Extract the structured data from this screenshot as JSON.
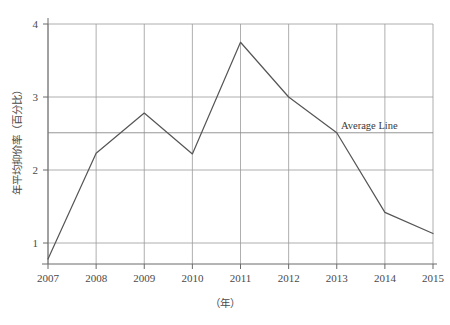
{
  "chart_data": {
    "type": "line",
    "title": "",
    "subtitle": "",
    "xlabel": "（年）",
    "ylabel": "年平均抑价率（百分比）",
    "categories": [
      "2007",
      "2008",
      "2009",
      "2010",
      "2011",
      "2012",
      "2013",
      "2014",
      "2015"
    ],
    "x": [
      2007,
      2008,
      2009,
      2010,
      2011,
      2012,
      2013,
      2014,
      2015
    ],
    "values": [
      0.78,
      2.23,
      2.78,
      2.22,
      3.75,
      3.0,
      2.51,
      1.42,
      1.13
    ],
    "series": [
      {
        "name": "年平均抑价率",
        "values": [
          0.78,
          2.23,
          2.78,
          2.22,
          3.75,
          3.0,
          2.51,
          1.42,
          1.13
        ]
      }
    ],
    "ylim": [
      0.55,
      4.15
    ],
    "xlim": [
      2007,
      2015
    ],
    "yticks": [
      1,
      2,
      3,
      4
    ],
    "ytick_labels": [
      "1",
      "2",
      "3",
      "4"
    ],
    "xtick_labels": [
      "2007",
      "2008",
      "2009",
      "2010",
      "2011",
      "2012",
      "2013",
      "2014",
      "2015"
    ],
    "grid": true,
    "grid_color": "#9a9a9a",
    "legend": "none",
    "line_color": "#555555",
    "annotations": [
      {
        "type": "hline",
        "label": "Average Line",
        "value": 2.51
      }
    ]
  },
  "axes": {
    "y_title": "年平均抑价率（百分比）",
    "x_title": "（年）",
    "y_ticks": [
      "1",
      "2",
      "3",
      "4"
    ],
    "x_ticks": [
      "2007",
      "2008",
      "2009",
      "2010",
      "2011",
      "2012",
      "2013",
      "2014",
      "2015"
    ]
  },
  "annotation": {
    "average_line_label": "Average Line"
  },
  "colors": {
    "background": "#ffffff",
    "line": "#555555",
    "grid": "#9a9a9a",
    "axis": "#6b6b6b",
    "text": "#3a3a3a"
  }
}
